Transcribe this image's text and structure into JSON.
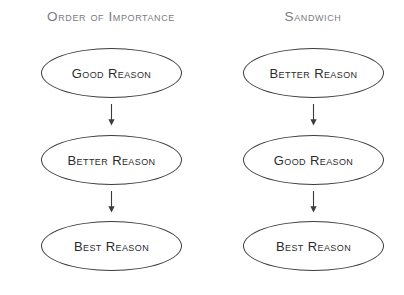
{
  "page": {
    "background_color": "#ffffff",
    "header_color": "#7b7b80",
    "node_text_color": "#2b2b2e",
    "node_stroke_color": "#3b3b40",
    "arrow_color": "#3b3b40",
    "width": 404,
    "height": 295
  },
  "diagram": {
    "type": "flowchart",
    "orientation": "vertical",
    "columns": [
      {
        "id": "order-of-importance",
        "header": "Order of Importance",
        "nodes": [
          {
            "label": "Good Reason",
            "shape": "ellipse"
          },
          {
            "label": "Better Reason",
            "shape": "ellipse"
          },
          {
            "label": "Best Reason",
            "shape": "ellipse"
          }
        ],
        "connectors": [
          {
            "icon": "arrow-down-icon",
            "glyph": "↓"
          },
          {
            "icon": "arrow-down-icon",
            "glyph": "↓"
          }
        ]
      },
      {
        "id": "sandwich",
        "header": "Sandwich",
        "nodes": [
          {
            "label": "Better Reason",
            "shape": "ellipse"
          },
          {
            "label": "Good Reason",
            "shape": "ellipse"
          },
          {
            "label": "Best Reason",
            "shape": "ellipse"
          }
        ],
        "connectors": [
          {
            "icon": "arrow-down-icon",
            "glyph": "↓"
          },
          {
            "icon": "arrow-down-icon",
            "glyph": "↓"
          }
        ]
      }
    ]
  }
}
